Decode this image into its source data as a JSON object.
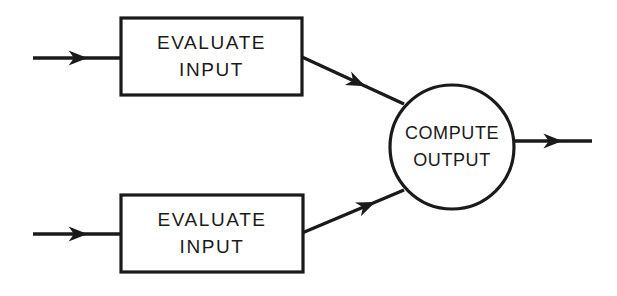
{
  "diagram": {
    "type": "flowchart",
    "title": "",
    "background_color": "#ffffff",
    "line_color": "#1a1a1a",
    "nodes": [
      {
        "id": "evaluate-input-top",
        "shape": "rectangle",
        "line1": "EVALUATE",
        "line2": "INPUT",
        "x": 121,
        "y": 18,
        "width": 181,
        "height": 77
      },
      {
        "id": "evaluate-input-bottom",
        "shape": "rectangle",
        "line1": "EVALUATE",
        "line2": "INPUT",
        "x": 121,
        "y": 195,
        "width": 182,
        "height": 77
      },
      {
        "id": "compute-output",
        "shape": "circle",
        "line1": "COMPUTE",
        "line2": "OUTPUT",
        "cx": 452,
        "cy": 147,
        "r": 62
      }
    ],
    "connectors": [
      {
        "id": "input-arrow-top",
        "from": "external-input-top",
        "to": "evaluate-input-top",
        "x1": 33,
        "y1": 58,
        "x2": 121,
        "y2": 58,
        "arrow_at": 0.62
      },
      {
        "id": "input-arrow-bottom",
        "from": "external-input-bottom",
        "to": "evaluate-input-bottom",
        "x1": 33,
        "y1": 234,
        "x2": 121,
        "y2": 234,
        "arrow_at": 0.62
      },
      {
        "id": "top-to-compute",
        "from": "evaluate-input-top",
        "to": "compute-output",
        "x1": 302,
        "y1": 57,
        "x2": 404,
        "y2": 104,
        "arrow_at": 0.62
      },
      {
        "id": "bottom-to-compute",
        "from": "evaluate-input-bottom",
        "to": "compute-output",
        "x1": 302,
        "y1": 233,
        "x2": 404,
        "y2": 190,
        "arrow_at": 0.72
      },
      {
        "id": "output-arrow",
        "from": "compute-output",
        "to": "external-output",
        "x1": 514,
        "y1": 141,
        "x2": 592,
        "y2": 141,
        "arrow_at": 0.62
      }
    ]
  }
}
